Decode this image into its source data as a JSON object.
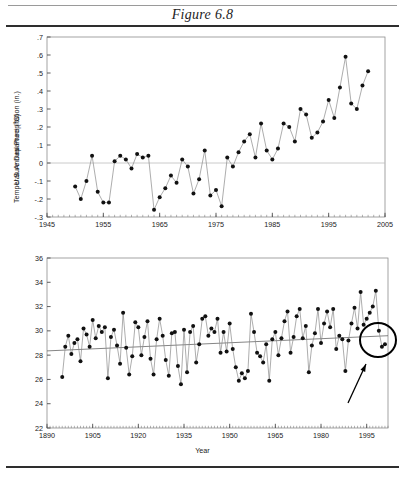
{
  "figure": {
    "title": "Figure 6.8"
  },
  "chart_data": [
    {
      "id": "temperature",
      "type": "line",
      "title": "",
      "xlabel": "",
      "ylabel": "Temperature Departure (°C)",
      "xlim": [
        1945,
        2005
      ],
      "ylim": [
        -0.3,
        0.7
      ],
      "xticks": [
        1945,
        1955,
        1965,
        1975,
        1985,
        1995,
        2005
      ],
      "xticklabels": [
        "1945",
        "1955",
        "1965",
        "1975",
        "1985",
        "1995",
        "2005"
      ],
      "yticks": [
        -0.3,
        -0.2,
        -0.1,
        0,
        0.1,
        0.2,
        0.3,
        0.4,
        0.5,
        0.6,
        0.7
      ],
      "yticklabels": [
        "-.3",
        "-.2",
        "-.1",
        "0",
        ".1",
        ".2",
        ".3",
        ".4",
        ".5",
        ".6",
        ".7"
      ],
      "minor_xtick_step": 1,
      "grid": false,
      "zero_line": 0,
      "markers": true,
      "x": [
        1950,
        1951,
        1952,
        1953,
        1954,
        1955,
        1956,
        1957,
        1958,
        1959,
        1960,
        1961,
        1962,
        1963,
        1964,
        1965,
        1966,
        1967,
        1968,
        1969,
        1970,
        1971,
        1972,
        1973,
        1974,
        1975,
        1976,
        1977,
        1978,
        1979,
        1980,
        1981,
        1982,
        1983,
        1984,
        1985,
        1986,
        1987,
        1988,
        1989,
        1990,
        1991,
        1992,
        1993,
        1994,
        1995,
        1996,
        1997,
        1998,
        1999,
        2000,
        2001,
        2002
      ],
      "values": [
        -0.13,
        -0.2,
        -0.1,
        0.04,
        -0.16,
        -0.22,
        -0.22,
        0.01,
        0.04,
        0.02,
        -0.03,
        0.05,
        0.03,
        0.04,
        -0.26,
        -0.19,
        -0.14,
        -0.07,
        -0.11,
        0.02,
        -0.02,
        -0.17,
        -0.09,
        0.07,
        -0.18,
        -0.15,
        -0.24,
        0.03,
        -0.02,
        0.06,
        0.12,
        0.16,
        0.03,
        0.22,
        0.07,
        0.02,
        0.08,
        0.22,
        0.2,
        0.12,
        0.3,
        0.27,
        0.14,
        0.17,
        0.23,
        0.35,
        0.25,
        0.42,
        0.59,
        0.33,
        0.3,
        0.43,
        0.51
      ]
    },
    {
      "id": "precipitation",
      "type": "line",
      "title": "",
      "xlabel": "Year",
      "ylabel": "U.S. Annual Precipitation (in.)",
      "xlim": [
        1890,
        2002
      ],
      "ylim": [
        22,
        36
      ],
      "xticks": [
        1890,
        1905,
        1920,
        1935,
        1950,
        1965,
        1980,
        1995
      ],
      "xticklabels": [
        "1890",
        "1905",
        "1920",
        "1935",
        "1950",
        "1965",
        "1980",
        "1995"
      ],
      "yticks": [
        22,
        24,
        26,
        28,
        30,
        32,
        34,
        36
      ],
      "yticklabels": [
        "22",
        "24",
        "26",
        "28",
        "30",
        "32",
        "34",
        "36"
      ],
      "minor_xtick_step": 1,
      "grid": false,
      "trend_line": {
        "x0": 1890,
        "y0": 28.35,
        "x1": 2002,
        "y1": 29.6
      },
      "markers": true,
      "x": [
        1895,
        1896,
        1897,
        1898,
        1899,
        1900,
        1901,
        1902,
        1903,
        1904,
        1905,
        1906,
        1907,
        1908,
        1909,
        1910,
        1911,
        1912,
        1913,
        1914,
        1915,
        1916,
        1917,
        1918,
        1919,
        1920,
        1921,
        1922,
        1923,
        1924,
        1925,
        1926,
        1927,
        1928,
        1929,
        1930,
        1931,
        1932,
        1933,
        1934,
        1935,
        1936,
        1937,
        1938,
        1939,
        1940,
        1941,
        1942,
        1943,
        1944,
        1945,
        1946,
        1947,
        1948,
        1949,
        1950,
        1951,
        1952,
        1953,
        1954,
        1955,
        1956,
        1957,
        1958,
        1959,
        1960,
        1961,
        1962,
        1963,
        1964,
        1965,
        1966,
        1967,
        1968,
        1969,
        1970,
        1971,
        1972,
        1973,
        1974,
        1975,
        1976,
        1977,
        1978,
        1979,
        1980,
        1981,
        1982,
        1983,
        1984,
        1985,
        1986,
        1987,
        1988,
        1989,
        1990,
        1991,
        1992,
        1993,
        1994,
        1995,
        1996,
        1997,
        1998,
        1999,
        2000,
        2001
      ],
      "values": [
        26.2,
        28.7,
        29.6,
        28.1,
        29.0,
        29.3,
        27.5,
        30.2,
        29.7,
        28.7,
        30.9,
        29.4,
        30.4,
        29.9,
        30.3,
        26.1,
        29.5,
        30.1,
        28.8,
        27.3,
        31.5,
        28.6,
        26.4,
        27.9,
        30.7,
        30.3,
        28.0,
        29.5,
        30.8,
        27.7,
        26.4,
        29.3,
        31.0,
        29.6,
        27.6,
        26.3,
        29.8,
        29.9,
        27.1,
        25.6,
        30.1,
        26.6,
        29.9,
        30.4,
        27.4,
        28.9,
        31.0,
        31.2,
        29.6,
        30.2,
        29.9,
        31.0,
        28.2,
        29.9,
        28.3,
        30.6,
        28.5,
        27.0,
        25.9,
        26.5,
        26.1,
        26.7,
        31.4,
        29.9,
        28.2,
        27.9,
        27.4,
        28.9,
        25.9,
        29.3,
        29.9,
        28.0,
        29.4,
        30.8,
        31.6,
        28.2,
        29.5,
        31.2,
        31.8,
        29.4,
        30.4,
        26.6,
        28.8,
        29.8,
        31.8,
        29.0,
        30.6,
        31.6,
        30.3,
        31.8,
        28.5,
        29.6,
        29.3,
        26.7,
        29.2,
        30.6,
        31.9,
        30.2,
        33.2,
        30.5,
        31.0,
        31.5,
        32.0,
        33.3,
        30.0,
        28.7,
        28.9
      ]
    }
  ],
  "annotations": {
    "circle": {
      "name": "highlight-circle",
      "cx": 378,
      "cy": 340,
      "rx": 18,
      "ry": 17
    },
    "arrow": {
      "name": "pointer-arrow",
      "x1": 348,
      "y1": 403,
      "x2": 366,
      "y2": 364
    }
  }
}
